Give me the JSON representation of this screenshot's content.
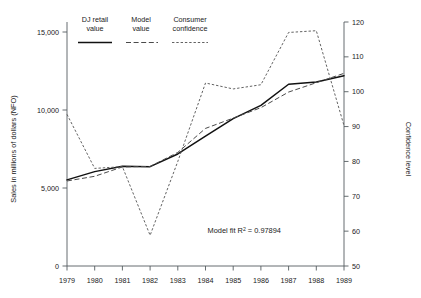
{
  "chart_data": {
    "type": "line",
    "title": "",
    "subtitle": "",
    "xlabel": "",
    "ylabel": "Sales in millions of dollars (NFO)",
    "y2label": "Confidence level",
    "grid": false,
    "legend_position": "top-left-inside",
    "x": [
      1979,
      1980,
      1981,
      1982,
      1983,
      1984,
      1985,
      1986,
      1987,
      1988,
      1989
    ],
    "categories": [
      "1979",
      "1980",
      "1981",
      "1982",
      "1983",
      "1984",
      "1985",
      "1986",
      "1987",
      "1988",
      "1989"
    ],
    "xlim": [
      1979,
      1989
    ],
    "ylim": [
      0,
      15000
    ],
    "yticks": [
      0,
      5000,
      10000,
      15000
    ],
    "ytick_labels": [
      "0",
      "5,000",
      "10,000",
      "15,000"
    ],
    "y2lim": [
      50,
      120
    ],
    "y2ticks": [
      50,
      60,
      70,
      80,
      90,
      100,
      110,
      120
    ],
    "y2tick_labels": [
      "50",
      "60",
      "70",
      "80",
      "90",
      "100",
      "110",
      "120"
    ],
    "series": [
      {
        "name": "DJ retail value",
        "axis": "left",
        "style": "solid",
        "color": "#111111",
        "values": [
          5520,
          6050,
          6400,
          6370,
          7180,
          8320,
          9450,
          10300,
          11650,
          11800,
          12200
        ]
      },
      {
        "name": "Model value",
        "axis": "left",
        "style": "dashed",
        "color": "#4a4a4a",
        "values": [
          5450,
          5750,
          6350,
          6380,
          7280,
          8820,
          9480,
          10150,
          11150,
          11750,
          12350
        ]
      },
      {
        "name": "Consumer confidence",
        "axis": "right",
        "style": "dotted",
        "color": "#5a5a5a",
        "values": [
          93.5,
          78.0,
          78.5,
          58.8,
          80.0,
          102.5,
          100.8,
          102.0,
          117.0,
          117.5,
          90.3
        ]
      }
    ],
    "annotations": [
      {
        "name": "model-fit-annotation",
        "text": "Model fit R² = 0.97894",
        "x": 1985.4,
        "y": 2100
      }
    ]
  },
  "legend": {
    "entries": [
      {
        "line1": "DJ retail",
        "line2": "value",
        "swatch": "solid-line-swatch"
      },
      {
        "line1": "Model",
        "line2": "value",
        "swatch": "dashed-line-swatch"
      },
      {
        "line1": "Consumer",
        "line2": "confidence",
        "swatch": "dotted-line-swatch"
      }
    ]
  },
  "annotation": {
    "model_fit_prefix": "Model fit R",
    "model_fit_exponent": "2",
    "model_fit_suffix": " = 0.97894",
    "model_fit_full": "Model fit R² = 0.97894"
  },
  "axes": {
    "left_title": "Sales in millions of dollars (NFO)",
    "right_title": "Confidence level"
  }
}
